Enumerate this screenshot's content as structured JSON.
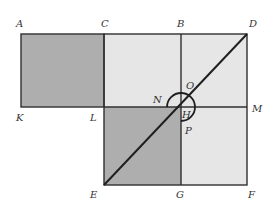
{
  "diagram": {
    "colors": {
      "dark_fill": "#aeaeae",
      "light_fill": "#e6e6e6",
      "stroke": "#2f2f2f",
      "label": "#333333"
    },
    "points": {
      "A": {
        "label": "A",
        "x": 21,
        "y": 34
      },
      "C": {
        "label": "C",
        "x": 104,
        "y": 34
      },
      "B": {
        "label": "B",
        "x": 181,
        "y": 34
      },
      "D": {
        "label": "D",
        "x": 247,
        "y": 34
      },
      "K": {
        "label": "K",
        "x": 21,
        "y": 107
      },
      "L": {
        "label": "L",
        "x": 104,
        "y": 107
      },
      "H": {
        "label": "H",
        "x": 181,
        "y": 107
      },
      "M": {
        "label": "M",
        "x": 247,
        "y": 107
      },
      "E": {
        "label": "E",
        "x": 104,
        "y": 185
      },
      "G": {
        "label": "G",
        "x": 181,
        "y": 185
      },
      "F": {
        "label": "F",
        "x": 247,
        "y": 185
      },
      "N": {
        "label": "N"
      },
      "O": {
        "label": "O"
      },
      "P": {
        "label": "P"
      }
    },
    "regions": [
      {
        "name": "rectangle-AKLC",
        "shade": "dark"
      },
      {
        "name": "square-CDFE",
        "shade": "light"
      },
      {
        "name": "square-LHGE",
        "shade": "dark"
      }
    ],
    "gnomon_arc": "NOP"
  }
}
